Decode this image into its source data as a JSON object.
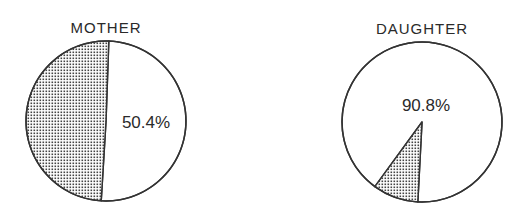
{
  "chart_data": [
    {
      "type": "pie",
      "title": "MOTHER",
      "slices": [
        {
          "label": "50.4%",
          "value": 50.4,
          "fill": "plain",
          "labeled": true
        },
        {
          "label": "",
          "value": 49.6,
          "fill": "dotted",
          "labeled": false
        }
      ]
    },
    {
      "type": "pie",
      "title": "DAUGHTER",
      "slices": [
        {
          "label": "90.8%",
          "value": 90.8,
          "fill": "plain",
          "labeled": true
        },
        {
          "label": "",
          "value": 9.2,
          "fill": "dotted",
          "labeled": false
        }
      ]
    }
  ],
  "colors": {
    "ink": "#333333",
    "background": "#ffffff",
    "dots": "#444444"
  }
}
